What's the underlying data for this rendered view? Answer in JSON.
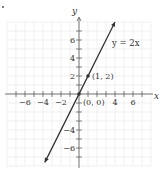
{
  "chart_data": {
    "type": "line",
    "title": "",
    "equation_label": "y = 2x",
    "xlabel": "x",
    "ylabel": "y",
    "xlim": [
      -8,
      8
    ],
    "ylim": [
      -8,
      8
    ],
    "grid": true,
    "x_tick_labels": [
      "-6",
      "-4",
      "-2",
      "4",
      "6"
    ],
    "x_tick_values": [
      -6,
      -4,
      -2,
      4,
      6
    ],
    "y_tick_labels": [
      "6",
      "4",
      "2",
      "-4",
      "-6"
    ],
    "y_tick_values": [
      6,
      4,
      2,
      -4,
      -6
    ],
    "series": [
      {
        "name": "y = 2x",
        "x": [
          -3.8,
          4.0
        ],
        "y": [
          -7.6,
          8.0
        ],
        "arrows": "both"
      }
    ],
    "points": [
      {
        "label": "(0, 0)",
        "x": 0,
        "y": 0
      },
      {
        "label": "(1, 2)",
        "x": 1,
        "y": 2
      }
    ]
  },
  "colors": {
    "grid": "#e6e6e6",
    "axis": "#555555",
    "line": "#333333",
    "text": "#333333"
  }
}
